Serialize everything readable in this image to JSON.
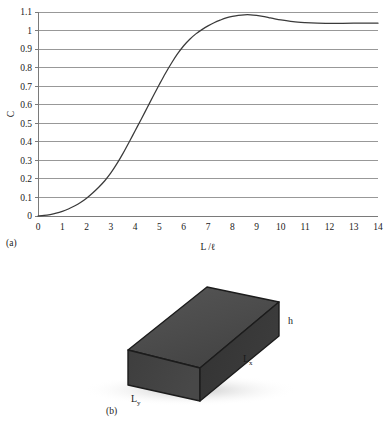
{
  "figure": {
    "panels": [
      {
        "caption": "(a)",
        "kind": "chart"
      },
      {
        "caption": "(b)",
        "kind": "diagram"
      }
    ]
  },
  "chart_data": {
    "type": "line",
    "title": "",
    "xlabel": "L /ℓ",
    "ylabel": "C",
    "xlim": [
      0,
      14
    ],
    "ylim": [
      0,
      1.1
    ],
    "grid": true,
    "grid_axis": "y",
    "legend": null,
    "xticks": [
      "0",
      "1",
      "2",
      "3",
      "4",
      "5",
      "6",
      "7",
      "8",
      "9",
      "10",
      "11",
      "12",
      "13",
      "14"
    ],
    "yticks": [
      "0",
      "0.1",
      "0.2",
      "0.3",
      "0.4",
      "0.5",
      "0.6",
      "0.7",
      "0.8",
      "0.9",
      "1",
      "1.1"
    ],
    "line_color": "#3a3a3a",
    "grid_color": "#8d8d8d",
    "series": [
      {
        "name": "C",
        "x": [
          0.0,
          0.25,
          0.5,
          0.75,
          1.0,
          1.25,
          1.5,
          1.75,
          2.0,
          2.25,
          2.5,
          2.75,
          3.0,
          3.25,
          3.5,
          3.75,
          4.0,
          4.25,
          4.5,
          4.75,
          5.0,
          5.25,
          5.5,
          5.75,
          6.0,
          6.25,
          6.5,
          6.75,
          7.0,
          7.25,
          7.5,
          7.75,
          8.0,
          8.25,
          8.5,
          8.75,
          9.0,
          9.25,
          9.5,
          9.75,
          10.0,
          10.5,
          11.0,
          11.5,
          12.0,
          12.5,
          13.0,
          13.5,
          14.0
        ],
        "y": [
          0.0,
          0.003,
          0.008,
          0.015,
          0.025,
          0.038,
          0.054,
          0.073,
          0.096,
          0.124,
          0.155,
          0.19,
          0.232,
          0.282,
          0.338,
          0.398,
          0.46,
          0.522,
          0.585,
          0.648,
          0.71,
          0.77,
          0.825,
          0.875,
          0.918,
          0.953,
          0.982,
          1.005,
          1.025,
          1.042,
          1.056,
          1.068,
          1.076,
          1.082,
          1.085,
          1.085,
          1.082,
          1.077,
          1.07,
          1.063,
          1.057,
          1.048,
          1.043,
          1.04,
          1.039,
          1.039,
          1.04,
          1.04,
          1.04
        ]
      }
    ]
  },
  "diagram": {
    "name": "rectangular-slab",
    "fill_top": "#4a4a4a",
    "fill_front": "#414141",
    "fill_side": "#363636",
    "edge_color": "#1c1c1c",
    "labels": {
      "height": {
        "base": "h",
        "sub": ""
      },
      "length_x": {
        "base": "L",
        "sub": "x"
      },
      "length_y": {
        "base": "L",
        "sub": "y"
      }
    }
  }
}
